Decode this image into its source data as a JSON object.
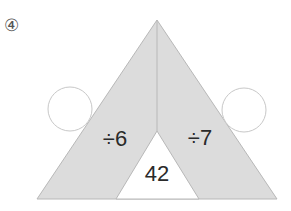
{
  "problem": {
    "number_label": "④",
    "left_operation": "÷6",
    "right_operation": "÷7",
    "bottom_value": "42",
    "left_answer": "",
    "right_answer": ""
  },
  "colors": {
    "shaded": "#dcdcdc",
    "stroke": "#b8b8b8",
    "text": "#2a2a2a",
    "circle_stroke": "#c8c8c8"
  }
}
